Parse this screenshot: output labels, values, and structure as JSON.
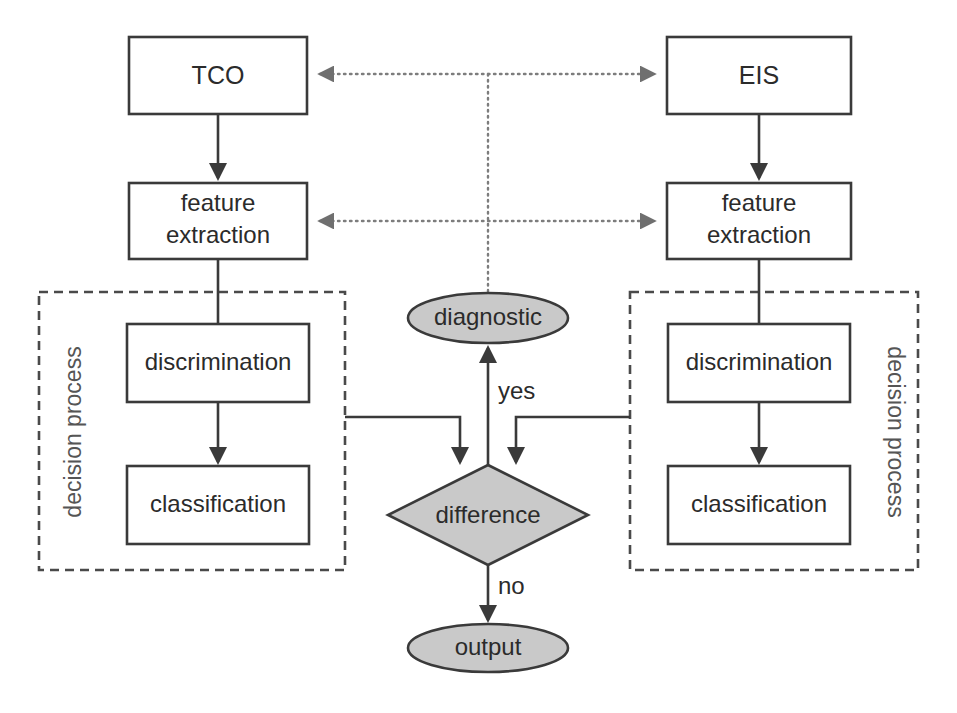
{
  "diagram": {
    "colors": {
      "shape_fill": "#ffffff",
      "shaded_fill": "#c9c9c9",
      "stroke": "#3a3a3a",
      "dotted_stroke": "#7d7d7d",
      "group_stroke": "#4a4a4a",
      "text": "#2b2b2b",
      "background": "#ffffff"
    },
    "nodes": {
      "tco": {
        "label": "TCO",
        "shape": "rectangle"
      },
      "eis": {
        "label": "EIS",
        "shape": "rectangle"
      },
      "feature_extraction_left_line1": {
        "label": "feature",
        "shape": "rectangle"
      },
      "feature_extraction_left_line2": {
        "label": "extraction",
        "shape": "rectangle"
      },
      "feature_extraction_right_line1": {
        "label": "feature",
        "shape": "rectangle"
      },
      "feature_extraction_right_line2": {
        "label": "extraction",
        "shape": "rectangle"
      },
      "discrimination_left": {
        "label": "discrimination",
        "shape": "rectangle"
      },
      "discrimination_right": {
        "label": "discrimination",
        "shape": "rectangle"
      },
      "classification_left": {
        "label": "classification",
        "shape": "rectangle"
      },
      "classification_right": {
        "label": "classification",
        "shape": "rectangle"
      },
      "diagnostic": {
        "label": "diagnostic",
        "shape": "ellipse"
      },
      "difference": {
        "label": "difference",
        "shape": "diamond"
      },
      "output": {
        "label": "output",
        "shape": "ellipse"
      }
    },
    "groups": {
      "decision_process_left": {
        "label": "decision process",
        "shape": "dashed-rectangle"
      },
      "decision_process_right": {
        "label": "decision process",
        "shape": "dashed-rectangle"
      }
    },
    "edge_labels": {
      "yes": "yes",
      "no": "no"
    }
  }
}
